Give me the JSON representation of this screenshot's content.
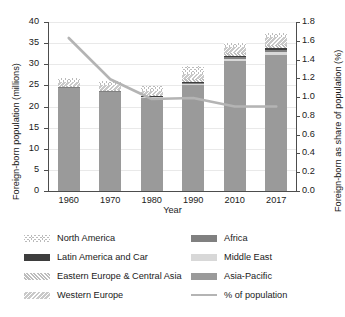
{
  "chart_data": {
    "type": "bar",
    "title": "",
    "xlabel": "Year",
    "ylabel": "Foreign-born population (millions)",
    "ylabel_right": "Foreign-born as share of population (%)",
    "categories": [
      "1960",
      "1970",
      "1980",
      "1990",
      "2010",
      "2017"
    ],
    "ylim": [
      0,
      40
    ],
    "yticks": [
      "0",
      "5",
      "10",
      "15",
      "20",
      "25",
      "30",
      "35",
      "40"
    ],
    "ylim_right": [
      0,
      1.8
    ],
    "yticks_right": [
      "0.0",
      "0.2",
      "0.4",
      "0.6",
      "0.8",
      "1.0",
      "1.2",
      "1.4",
      "1.6",
      "1.8"
    ],
    "grid": true,
    "legend_position": "below",
    "stack_order_bottom_to_top": [
      "Asia-Pacific",
      "Middle East",
      "Africa",
      "Latin America and Car",
      "Eastern Europe & Central Asia",
      "Western Europe",
      "North America"
    ],
    "series": [
      {
        "name": "Asia-Pacific",
        "values": [
          24.4,
          23.4,
          22.0,
          25.0,
          30.7,
          32.3
        ]
      },
      {
        "name": "Middle East",
        "values": [
          0.1,
          0.15,
          0.2,
          0.35,
          0.5,
          0.6
        ]
      },
      {
        "name": "Africa",
        "values": [
          0.1,
          0.1,
          0.15,
          0.3,
          0.45,
          0.55
        ]
      },
      {
        "name": "Latin America and Car",
        "values": [
          0.1,
          0.1,
          0.15,
          0.25,
          0.35,
          0.4
        ]
      },
      {
        "name": "Eastern Europe & Central Asia",
        "values": [
          0.2,
          0.25,
          0.3,
          0.5,
          0.6,
          0.7
        ]
      },
      {
        "name": "Western Europe",
        "values": [
          0.8,
          1.0,
          0.9,
          1.3,
          1.5,
          1.8
        ]
      },
      {
        "name": "North America",
        "values": [
          1.0,
          1.1,
          1.1,
          2.0,
          1.0,
          1.05
        ]
      }
    ],
    "totals": [
      26.7,
      26.1,
      24.8,
      29.7,
      35.1,
      37.4
    ],
    "line_series": {
      "name": "% of population",
      "values": [
        1.63,
        1.19,
        0.98,
        0.99,
        0.9,
        0.9
      ],
      "axis": "right"
    }
  },
  "legend": {
    "items": [
      {
        "label": "North America",
        "swatch": "north",
        "type": "patch"
      },
      {
        "label": "Latin America and Car",
        "swatch": "latin",
        "type": "patch"
      },
      {
        "label": "Eastern Europe & Central Asia",
        "swatch": "east",
        "type": "patch"
      },
      {
        "label": "Western Europe",
        "swatch": "west",
        "type": "patch"
      },
      {
        "label": "Africa",
        "swatch": "africa",
        "type": "patch"
      },
      {
        "label": "Middle East",
        "swatch": "middle",
        "type": "patch"
      },
      {
        "label": "Asia-Pacific",
        "swatch": "asia",
        "type": "patch"
      },
      {
        "label": "% of population",
        "swatch": "line",
        "type": "line"
      }
    ]
  },
  "colors": {
    "asia_pacific": "#9a9a9a",
    "middle_east": "#d8d8d8",
    "africa": "#808080",
    "latin_america": "#3d3d3d",
    "eastern_europe": "#bdbdbd",
    "western_europe": "#c9c9c9",
    "north_america": "#bbbbbb",
    "line": "#b4b4b4",
    "grid": "#e9e9e9",
    "axis": "#4d4d4d"
  }
}
